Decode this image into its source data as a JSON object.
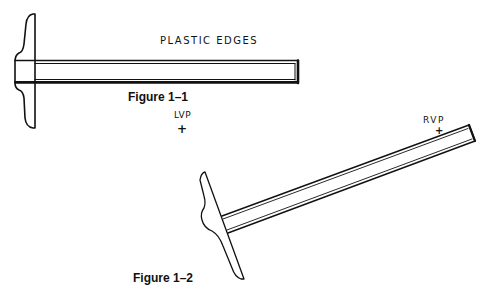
{
  "figures": [
    {
      "id": "figure-1-1",
      "caption": "Figure 1–1",
      "annotation": "PLASTIC EDGES",
      "object": "T-square horizontal"
    },
    {
      "id": "figure-1-2",
      "caption": "Figure 1–2",
      "object": "T-square angled"
    }
  ],
  "vanishing_points": [
    {
      "label": "LVP",
      "marker": "+"
    },
    {
      "label": "RVP",
      "marker": "+"
    }
  ],
  "colors": {
    "ink": "#111111",
    "background": "#ffffff"
  }
}
